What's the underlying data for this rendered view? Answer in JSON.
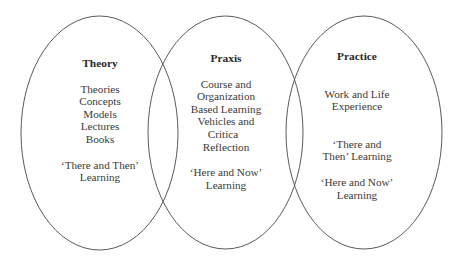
{
  "diagram": {
    "type": "venn",
    "colors": {
      "background": "#ffffff",
      "stroke": "#5a5a5a",
      "text": "#3a3a3a"
    },
    "circles": [
      {
        "id": "theory",
        "title": "Theory",
        "items": [
          "Theories",
          "Concepts",
          "Models",
          "Lectures",
          "Books"
        ],
        "learning": [
          "‘There and Then’",
          "Learning"
        ]
      },
      {
        "id": "praxis",
        "title": "Praxis",
        "items": [
          "Course and",
          "Organization",
          "Based Learning",
          "Vehicles and",
          "Critica",
          "Reflection"
        ],
        "learning": [
          "‘Here and Now’",
          "Learning"
        ]
      },
      {
        "id": "practice",
        "title": "Practice",
        "items": [
          "Work and Life",
          "Experience"
        ],
        "learning_then": [
          "‘There and",
          "Then’ Learning"
        ],
        "learning_now": [
          "‘Here and Now’",
          "Learning"
        ]
      }
    ]
  }
}
